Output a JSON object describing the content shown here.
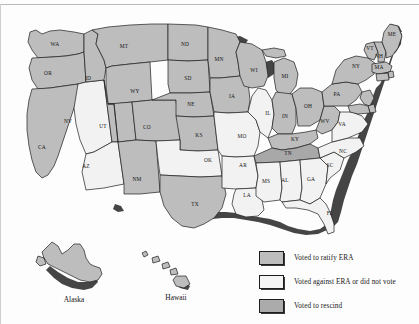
{
  "figure": {
    "type": "choropleth-map",
    "region": "United States",
    "topic": "Equal Rights Amendment (ERA) state ratification status"
  },
  "legend": {
    "items": [
      {
        "key": "ratify",
        "label": "Voted to ratify ERA",
        "swatch": "ratify",
        "color": "#bdbdbd"
      },
      {
        "key": "against",
        "label": "Voted against ERA or did not vote",
        "swatch": "against",
        "color": "#f4f4f4"
      },
      {
        "key": "rescind",
        "label": "Voted to rescind",
        "swatch": "rescind",
        "color": "#ababab"
      }
    ]
  },
  "insets": {
    "alaska_label": "Alaska",
    "hawaii_label": "Hawaii"
  },
  "states": [
    {
      "abbr": "WA",
      "status": "ratify",
      "x": 55,
      "y": 45
    },
    {
      "abbr": "OR",
      "status": "ratify",
      "x": 48,
      "y": 74
    },
    {
      "abbr": "CA",
      "status": "ratify",
      "x": 42,
      "y": 148
    },
    {
      "abbr": "NV",
      "status": "against",
      "x": 68,
      "y": 122
    },
    {
      "abbr": "ID",
      "status": "ratify",
      "x": 88,
      "y": 79
    },
    {
      "abbr": "MT",
      "status": "ratify",
      "x": 124,
      "y": 47
    },
    {
      "abbr": "WY",
      "status": "ratify",
      "x": 135,
      "y": 92
    },
    {
      "abbr": "UT",
      "status": "ratify",
      "x": 103,
      "y": 127
    },
    {
      "abbr": "AZ",
      "status": "against",
      "x": 86,
      "y": 167
    },
    {
      "abbr": "CO",
      "status": "ratify",
      "x": 147,
      "y": 128
    },
    {
      "abbr": "NM",
      "status": "ratify",
      "x": 137,
      "y": 180
    },
    {
      "abbr": "ND",
      "status": "ratify",
      "x": 185,
      "y": 45
    },
    {
      "abbr": "SD",
      "status": "ratify",
      "x": 188,
      "y": 79
    },
    {
      "abbr": "NE",
      "status": "ratify",
      "x": 191,
      "y": 105
    },
    {
      "abbr": "KS",
      "status": "ratify",
      "x": 199,
      "y": 136
    },
    {
      "abbr": "OK",
      "status": "against",
      "x": 208,
      "y": 161
    },
    {
      "abbr": "TX",
      "status": "ratify",
      "x": 195,
      "y": 205
    },
    {
      "abbr": "MN",
      "status": "ratify",
      "x": 219,
      "y": 60
    },
    {
      "abbr": "IA",
      "status": "ratify",
      "x": 232,
      "y": 97
    },
    {
      "abbr": "MO",
      "status": "against",
      "x": 242,
      "y": 137
    },
    {
      "abbr": "AR",
      "status": "against",
      "x": 243,
      "y": 166
    },
    {
      "abbr": "LA",
      "status": "against",
      "x": 247,
      "y": 196
    },
    {
      "abbr": "WI",
      "status": "ratify",
      "x": 254,
      "y": 71
    },
    {
      "abbr": "IL",
      "status": "against",
      "x": 268,
      "y": 114
    },
    {
      "abbr": "MS",
      "status": "against",
      "x": 266,
      "y": 182
    },
    {
      "abbr": "MI",
      "status": "ratify",
      "x": 285,
      "y": 77
    },
    {
      "abbr": "IN",
      "status": "ratify",
      "x": 285,
      "y": 117
    },
    {
      "abbr": "KY",
      "status": "ratify",
      "x": 295,
      "y": 140
    },
    {
      "abbr": "TN",
      "status": "rescind",
      "x": 288,
      "y": 154
    },
    {
      "abbr": "AL",
      "status": "against",
      "x": 285,
      "y": 181
    },
    {
      "abbr": "GA",
      "status": "against",
      "x": 311,
      "y": 180
    },
    {
      "abbr": "FL",
      "status": "against",
      "x": 330,
      "y": 214
    },
    {
      "abbr": "OH",
      "status": "ratify",
      "x": 308,
      "y": 107
    },
    {
      "abbr": "WV",
      "status": "ratify",
      "x": 325,
      "y": 122
    },
    {
      "abbr": "VA",
      "status": "against",
      "x": 342,
      "y": 125
    },
    {
      "abbr": "NC",
      "status": "against",
      "x": 343,
      "y": 152
    },
    {
      "abbr": "SC",
      "status": "against",
      "x": 330,
      "y": 166
    },
    {
      "abbr": "PA",
      "status": "ratify",
      "x": 337,
      "y": 95
    },
    {
      "abbr": "NY",
      "status": "ratify",
      "x": 356,
      "y": 67
    },
    {
      "abbr": "VT",
      "status": "ratify",
      "x": 370,
      "y": 49
    },
    {
      "abbr": "NH",
      "status": "ratify",
      "x": 379,
      "y": 57
    },
    {
      "abbr": "MA",
      "status": "ratify",
      "x": 379,
      "y": 68
    },
    {
      "abbr": "ME",
      "status": "ratify",
      "x": 392,
      "y": 35
    },
    {
      "abbr": "AK",
      "status": "ratify",
      "x": 0,
      "y": 0
    },
    {
      "abbr": "HI",
      "status": "ratify",
      "x": 0,
      "y": 0
    }
  ]
}
